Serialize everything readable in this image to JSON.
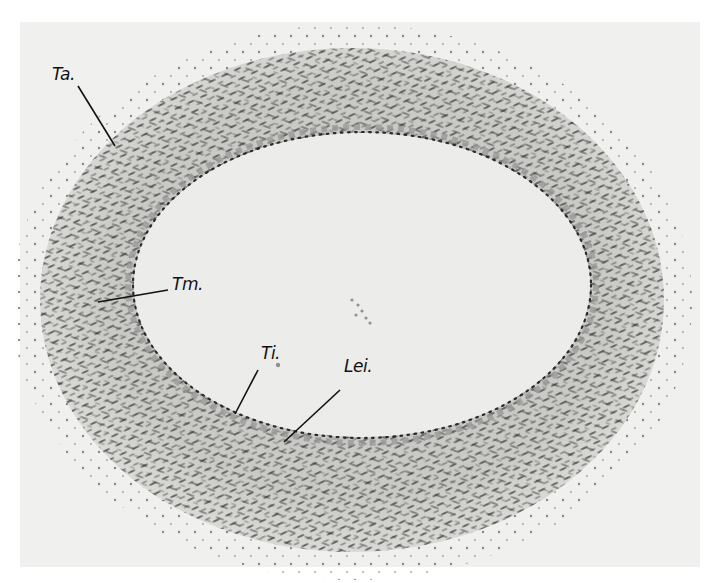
{
  "figure": {
    "colors": {
      "background": "#f0f0ee",
      "tissue": "#cfcfcc",
      "nuclei": "#2a2a2a",
      "lumen": "#ececea",
      "label": "#111111"
    },
    "labels": [
      {
        "id": "ta",
        "text": "Ta.",
        "x": 52,
        "y": 72,
        "line": [
          78,
          86,
          115,
          146
        ]
      },
      {
        "id": "tm",
        "text": "Tm.",
        "x": 172,
        "y": 281,
        "line": [
          98,
          302,
          168,
          290
        ]
      },
      {
        "id": "ti",
        "text": "Ti.",
        "x": 261,
        "y": 350,
        "line": [
          258,
          370,
          235,
          414
        ]
      },
      {
        "id": "lei",
        "text": "Lei.",
        "x": 344,
        "y": 363,
        "line": [
          340,
          390,
          284,
          442
        ]
      }
    ]
  }
}
